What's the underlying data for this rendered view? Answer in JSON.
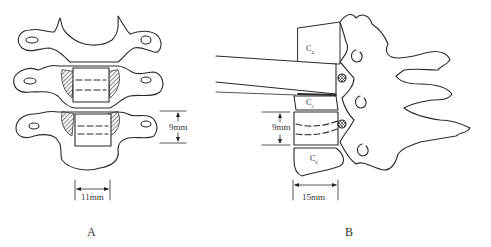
{
  "figure": {
    "panels": [
      {
        "id": "A",
        "label": "A",
        "view": "anterior",
        "dimensions": {
          "height_label": "9mm",
          "width_label": "11mm"
        }
      },
      {
        "id": "B",
        "label": "B",
        "view": "lateral",
        "vertebrae": [
          {
            "label": "C",
            "sub": "4"
          },
          {
            "label": "C",
            "sub": "5"
          },
          {
            "label": "C",
            "sub": "6"
          }
        ],
        "dimensions": {
          "height_label": "9mm",
          "width_label": "15mm"
        }
      }
    ]
  }
}
